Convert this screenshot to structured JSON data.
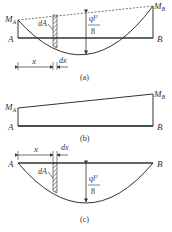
{
  "figure": {
    "panels": [
      {
        "id": "a",
        "caption": "(a)",
        "labels": {
          "left_moment": "M",
          "left_moment_sub": "A",
          "right_moment": "M",
          "right_moment_sub": "B",
          "left_support": "A",
          "right_support": "B",
          "area_element": "dA",
          "moment_numerator": "ql",
          "moment_numerator_sup": "2",
          "moment_denominator": "8",
          "distance": "x",
          "increment": "dx"
        }
      },
      {
        "id": "b",
        "caption": "(b)",
        "labels": {
          "left_moment": "M",
          "left_moment_sub": "A",
          "right_moment": "M",
          "right_moment_sub": "B",
          "left_support": "A",
          "right_support": "B"
        }
      },
      {
        "id": "c",
        "caption": "(c)",
        "labels": {
          "left_support": "A",
          "right_support": "B",
          "area_element": "dA",
          "moment_numerator": "ql",
          "moment_numerator_sup": "2",
          "moment_denominator": "8",
          "distance": "x",
          "increment": "dx"
        }
      }
    ],
    "colors": {
      "line": "#333333",
      "background": "#ffffff"
    }
  }
}
